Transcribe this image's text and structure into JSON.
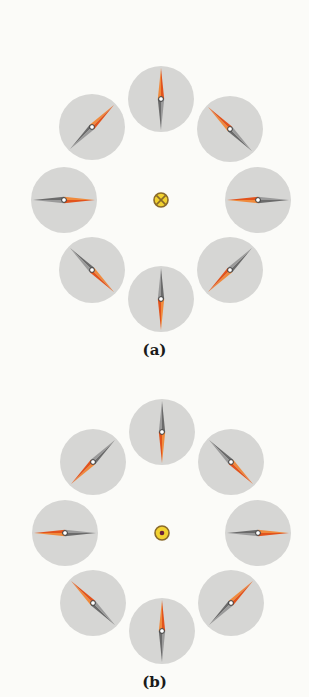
{
  "colors": {
    "background": "#fbfbf8",
    "compass_face": "#d6d6d4",
    "needle_north": "#e2531c",
    "needle_north_light": "#f08a3c",
    "needle_south": "#6b6b6b",
    "needle_south_light": "#9a9a9a",
    "pivot": "#ffffff",
    "wire_fill": "#f2d230",
    "wire_stroke": "#8a6a2a",
    "wire_dot": "#6a1f3a"
  },
  "compass_radius": 33,
  "needle_half_length": 31,
  "panels": [
    {
      "id": "a",
      "label": "(a)",
      "current_direction": "into-page",
      "center_symbol": "cross",
      "field_circulation": "clockwise",
      "center": [
        161,
        200
      ],
      "label_y": 341,
      "compasses": [
        {
          "position": "top",
          "dx": 0,
          "dy": -101,
          "north_angle_deg": 90
        },
        {
          "position": "top-right",
          "dx": 69,
          "dy": -71,
          "north_angle_deg": 135
        },
        {
          "position": "right",
          "dx": 97,
          "dy": 0,
          "north_angle_deg": 180
        },
        {
          "position": "bottom-right",
          "dx": 69,
          "dy": 70,
          "north_angle_deg": 225
        },
        {
          "position": "bottom",
          "dx": 0,
          "dy": 99,
          "north_angle_deg": 270
        },
        {
          "position": "bottom-left",
          "dx": -69,
          "dy": 70,
          "north_angle_deg": 315
        },
        {
          "position": "left",
          "dx": -97,
          "dy": 0,
          "north_angle_deg": 0
        },
        {
          "position": "top-left",
          "dx": -69,
          "dy": -73,
          "north_angle_deg": 45
        }
      ]
    },
    {
      "id": "b",
      "label": "(b)",
      "current_direction": "out-of-page",
      "center_symbol": "dot",
      "field_circulation": "counterclockwise",
      "center": [
        162,
        533
      ],
      "label_y": 673,
      "compasses": [
        {
          "position": "top",
          "dx": 0,
          "dy": -101,
          "north_angle_deg": 270
        },
        {
          "position": "top-right",
          "dx": 69,
          "dy": -71,
          "north_angle_deg": 315
        },
        {
          "position": "right",
          "dx": 96,
          "dy": 0,
          "north_angle_deg": 0
        },
        {
          "position": "bottom-right",
          "dx": 69,
          "dy": 70,
          "north_angle_deg": 45
        },
        {
          "position": "bottom",
          "dx": 0,
          "dy": 98,
          "north_angle_deg": 90
        },
        {
          "position": "bottom-left",
          "dx": -69,
          "dy": 70,
          "north_angle_deg": 135
        },
        {
          "position": "left",
          "dx": -97,
          "dy": 0,
          "north_angle_deg": 180
        },
        {
          "position": "top-left",
          "dx": -69,
          "dy": -71,
          "north_angle_deg": 225
        }
      ]
    }
  ]
}
